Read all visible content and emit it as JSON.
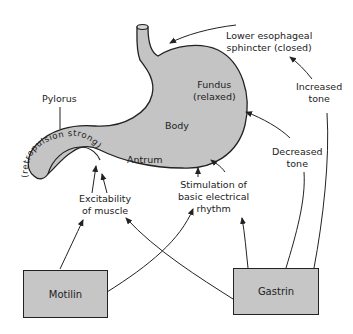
{
  "diagram": {
    "stomach_regions": {
      "fundus": "Fundus",
      "fundus_state": "(relaxed)",
      "body": "Body",
      "antrum": "Antrum",
      "pylorus": "Pylorus",
      "pylorus_note": "(retropulsion strong)"
    },
    "labels": {
      "les_line1": "Lower esophageal",
      "les_line2": "sphincter (closed)",
      "increased_tone_1": "Increased",
      "increased_tone_2": "tone",
      "decreased_tone_1": "Decreased",
      "decreased_tone_2": "tone",
      "stim_1": "Stimulation of",
      "stim_2": "basic electrical",
      "stim_3": "rhythm",
      "excit_1": "Excitability",
      "excit_2": "of muscle"
    },
    "hormones": {
      "motilin": "Motilin",
      "gastrin": "Gastrin"
    },
    "colors": {
      "stomach_fill": "#c4c4c4",
      "box_fill": "#c6c6c6",
      "line": "#222222"
    }
  }
}
